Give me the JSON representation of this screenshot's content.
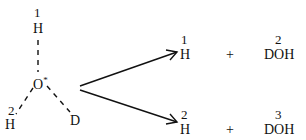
{
  "molecule": {
    "center": "O",
    "center_mark": "*",
    "atoms": [
      {
        "label": "H",
        "number": "1",
        "position": "top"
      },
      {
        "label": "H",
        "number": "2",
        "position": "bottom-left"
      },
      {
        "label": "D",
        "number": "",
        "position": "bottom-right"
      }
    ]
  },
  "products": [
    {
      "left_number": "1",
      "left": "H",
      "plus": "+",
      "right_number": "2",
      "right": "DOH"
    },
    {
      "left_number": "2",
      "left": "H",
      "plus": "+",
      "right_number": "3",
      "right": "DOH"
    }
  ]
}
